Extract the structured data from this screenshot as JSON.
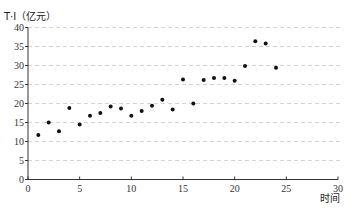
{
  "chart_data": {
    "type": "scatter",
    "title": "",
    "ylabel": "T·I（亿元）",
    "xlabel": "时间",
    "xlim": [
      0,
      30
    ],
    "ylim": [
      0,
      40
    ],
    "x_ticks": [
      0,
      5,
      10,
      15,
      20,
      25,
      30
    ],
    "y_ticks": [
      0,
      5,
      10,
      15,
      20,
      25,
      30,
      35,
      40
    ],
    "grid": "horizontal dashed",
    "legend": null,
    "series": [
      {
        "name": "T·I",
        "x": [
          1,
          2,
          3,
          4,
          5,
          6,
          7,
          8,
          9,
          10,
          11,
          12,
          13,
          14,
          15,
          16,
          17,
          18,
          19,
          20,
          21,
          22,
          23,
          24
        ],
        "y": [
          11.7,
          15.0,
          12.7,
          18.8,
          14.5,
          16.8,
          17.5,
          19.2,
          18.7,
          16.8,
          18.0,
          19.4,
          21.0,
          18.4,
          26.3,
          20.0,
          26.2,
          26.7,
          26.7,
          26.0,
          29.9,
          36.4,
          35.8,
          29.4
        ]
      }
    ]
  },
  "labels": {
    "y_axis_title": "T·I（亿元）",
    "x_axis_title": "时间"
  }
}
